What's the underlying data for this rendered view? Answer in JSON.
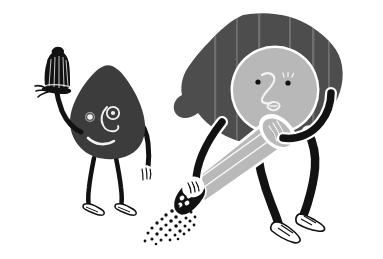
{
  "scene": {
    "title": "Salt and Pepper Characters Illustration",
    "description": "Black and white cartoon of two anthropomorphic figures: a dark blob-shaped salt character holding a salt shaker aloft, and a larger pepper character with dark hair grinding a pepper mill that scatters pepper flakes.",
    "width": 383,
    "height": 259,
    "background_color": "#ffffff"
  },
  "palette": {
    "background": "#ffffff",
    "ink_black": "#121212",
    "body_dark_gray": "#3c3c3c",
    "hair_gray": "#4d4d4d",
    "head_light_gray": "#b4b4b4",
    "grinder_gray": "#b9b9b9",
    "outline_white": "#ffffff",
    "streak_gray": "#5a5a5a"
  },
  "characters": [
    {
      "id": "salt-character",
      "name": "Salt Shaker Character",
      "body_label": "salt-body",
      "body_color": "#3c3c3c",
      "face": {
        "left_eye": "dot-eye",
        "right_eye": "ring-eye",
        "nose": "curved-s-nose",
        "mouth": "smile-curve"
      },
      "holds": "salt-shaker",
      "arms": 2,
      "legs": 2,
      "shoes": 2
    },
    {
      "id": "pepper-character",
      "name": "Pepper Mill Character",
      "hair_label": "pepper-hair",
      "hair_color": "#4d4d4d",
      "head_color": "#b4b4b4",
      "face": {
        "left_eye": "dot-eye",
        "right_eye": "lashed-dot-eye",
        "nose": "curved-2-nose",
        "mouth": "small-open-mouth"
      },
      "holds": "pepper-grinder",
      "arms": 2,
      "legs": 2,
      "shoes": 2
    }
  ],
  "props": [
    {
      "id": "salt-shaker",
      "name": "Salt Shaker",
      "color": "#121212",
      "detail": "ribbed dome with flared base"
    },
    {
      "id": "pepper-grinder",
      "name": "Pepper Grinder",
      "color": "#b9b9b9",
      "detail": "tapered cylinder with dark grinding head"
    }
  ],
  "particles": {
    "name": "pepper-flakes",
    "color": "#121212",
    "count": 34,
    "direction": "down-left"
  }
}
